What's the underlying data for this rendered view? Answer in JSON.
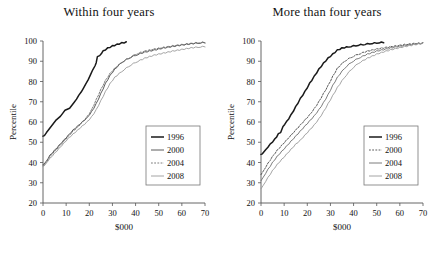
{
  "figure": {
    "panels": [
      {
        "title": "Within four years"
      },
      {
        "title": "More than four years"
      }
    ],
    "legend_labels": [
      "1996",
      "2000",
      "2004",
      "2008"
    ]
  },
  "chart_data": [
    {
      "type": "line",
      "title": "Within four years",
      "xlabel": "$000",
      "ylabel": "Percentile",
      "xlim": [
        0,
        70
      ],
      "ylim": [
        20,
        100
      ],
      "xticks": [
        0,
        10,
        20,
        30,
        40,
        50,
        60,
        70
      ],
      "yticks": [
        20,
        30,
        40,
        50,
        60,
        70,
        80,
        90,
        100
      ],
      "grid": false,
      "legend_position": "center-right",
      "series": [
        {
          "name": "1996",
          "color": "#1a1a1a",
          "width": 1.5,
          "dash": "none",
          "x": [
            0,
            0.6,
            1.5,
            2.5,
            3.5,
            4.5,
            5.5,
            6.5,
            7.5,
            8.5,
            9.5,
            10.5,
            11.5,
            12.5,
            13.5,
            14.5,
            15.5,
            16.5,
            17.5,
            18.5,
            19.5,
            20.5,
            21.5,
            22.5,
            23.0,
            23.5,
            24.5,
            26.0,
            28.0,
            30.0,
            32.0,
            34.0,
            36.0
          ],
          "y": [
            53,
            53.5,
            55,
            56.5,
            58,
            59.5,
            61,
            62,
            63,
            64.5,
            66,
            66.5,
            67,
            68.5,
            70,
            71.5,
            73.5,
            75,
            77,
            79,
            81,
            83.5,
            86,
            88,
            89.5,
            92.5,
            93,
            95,
            96.5,
            97.5,
            98.3,
            99,
            99.4
          ]
        },
        {
          "name": "2000",
          "color": "#4a4a4a",
          "width": 0.9,
          "dash": "none",
          "x": [
            0,
            0.5,
            1.5,
            3,
            5,
            7,
            9,
            11,
            13,
            15,
            17,
            19,
            21,
            23,
            25,
            27,
            29,
            31,
            34,
            37,
            40,
            44,
            48,
            52,
            56,
            60,
            64,
            67,
            70
          ],
          "y": [
            39,
            39.5,
            41,
            43.5,
            46,
            48.5,
            51,
            53.5,
            56,
            58,
            60,
            62,
            65,
            69,
            74,
            79,
            83,
            86,
            89.5,
            91.5,
            93,
            94.5,
            95.5,
            96.5,
            97.3,
            98,
            98.6,
            99,
            99.2
          ]
        },
        {
          "name": "2004",
          "color": "#6e6e6e",
          "width": 0.9,
          "dash": "1.8,1.4",
          "x": [
            0,
            0.5,
            1.5,
            3,
            5,
            7,
            9,
            11,
            13,
            15,
            17,
            19,
            21,
            23,
            25,
            27,
            29,
            31,
            34,
            37,
            40,
            44,
            48,
            52,
            56,
            60,
            64,
            67,
            70
          ],
          "y": [
            38.5,
            39,
            40.5,
            43,
            45.5,
            48,
            50.5,
            53,
            55.5,
            57.5,
            60,
            62.5,
            66,
            71,
            76,
            80.5,
            84,
            86.5,
            89.5,
            91.5,
            93.5,
            95,
            96,
            96.8,
            97.6,
            98.2,
            98.8,
            99.2,
            99.4
          ]
        },
        {
          "name": "2008",
          "color": "#9a9a9a",
          "width": 0.9,
          "dash": "none",
          "x": [
            0,
            0.5,
            1.5,
            3,
            5,
            7,
            9,
            11,
            13,
            15,
            17,
            19,
            21,
            23,
            25,
            27,
            29,
            31,
            34,
            37,
            40,
            44,
            48,
            52,
            56,
            60,
            64,
            67,
            70
          ],
          "y": [
            38,
            38.5,
            40,
            42,
            44.5,
            47,
            49.5,
            52,
            54,
            56,
            58,
            60,
            62.5,
            66,
            70.5,
            75,
            79,
            82,
            85,
            87.5,
            89.5,
            91.5,
            93,
            94,
            95,
            95.8,
            96.6,
            97,
            97.3
          ]
        }
      ]
    },
    {
      "type": "line",
      "title": "More than four years",
      "xlabel": "$000",
      "ylabel": "Percentile",
      "xlim": [
        0,
        70
      ],
      "ylim": [
        20,
        100
      ],
      "xticks": [
        0,
        10,
        20,
        30,
        40,
        50,
        60,
        70
      ],
      "yticks": [
        20,
        30,
        40,
        50,
        60,
        70,
        80,
        90,
        100
      ],
      "grid": false,
      "legend_position": "center-right",
      "series": [
        {
          "name": "1996",
          "color": "#1a1a1a",
          "width": 1.5,
          "dash": "none",
          "x": [
            0,
            0.6,
            2,
            4,
            6,
            7.5,
            8.5,
            9.5,
            11,
            13,
            15,
            17,
            19,
            21,
            23,
            25,
            27,
            29,
            31,
            33,
            35,
            38,
            41,
            44,
            47,
            50,
            53
          ],
          "y": [
            44,
            44.5,
            46.5,
            49,
            51.5,
            54,
            55,
            58,
            60,
            63.5,
            67.5,
            71.5,
            75,
            79,
            82.5,
            86,
            89,
            91.5,
            93.5,
            95.5,
            96.5,
            97.2,
            97.8,
            98.3,
            98.7,
            99.1,
            99.4
          ]
        },
        {
          "name": "2000",
          "color": "#4a4a4a",
          "width": 0.9,
          "dash": "1.8,1.4",
          "x": [
            0,
            1,
            3,
            5,
            7,
            9,
            11,
            13,
            15,
            17,
            19,
            21,
            23,
            25,
            27,
            29,
            31,
            33,
            36,
            39,
            42,
            46,
            50,
            54,
            58,
            62,
            66,
            70
          ],
          "y": [
            34,
            36,
            39.5,
            43,
            46,
            48.5,
            51,
            53.5,
            56,
            58.5,
            61,
            63.5,
            66.5,
            70,
            74,
            78,
            82.5,
            86.5,
            90,
            92,
            93.5,
            95,
            96,
            96.8,
            97.5,
            98.2,
            98.7,
            99
          ]
        },
        {
          "name": "2004",
          "color": "#6e6e6e",
          "width": 0.9,
          "dash": "none",
          "x": [
            0,
            1,
            3,
            5,
            7,
            9,
            11,
            13,
            15,
            17,
            19,
            21,
            23,
            25,
            27,
            29,
            31,
            33,
            36,
            39,
            42,
            46,
            50,
            54,
            58,
            62,
            66,
            70
          ],
          "y": [
            31,
            33,
            36.5,
            40,
            43,
            45.5,
            48,
            50.5,
            53,
            55.5,
            58,
            60.5,
            63,
            66,
            69.5,
            73.5,
            78,
            82,
            86.5,
            89.5,
            91.5,
            93.5,
            95,
            96,
            97,
            97.8,
            98.4,
            98.9
          ]
        },
        {
          "name": "2008",
          "color": "#9a9a9a",
          "width": 0.9,
          "dash": "none",
          "x": [
            0,
            1,
            3,
            5,
            7,
            9,
            11,
            13,
            15,
            17,
            19,
            21,
            23,
            25,
            27,
            29,
            31,
            33,
            36,
            39,
            42,
            46,
            50,
            54,
            58,
            62,
            66,
            70
          ],
          "y": [
            27,
            29,
            32.5,
            36,
            39,
            41.5,
            44,
            46.5,
            49,
            51,
            53.5,
            56,
            58.5,
            61.5,
            65,
            69,
            73,
            77,
            82,
            86,
            89,
            91.5,
            93.5,
            95,
            96.2,
            97.2,
            98.1,
            98.8
          ]
        }
      ]
    }
  ]
}
